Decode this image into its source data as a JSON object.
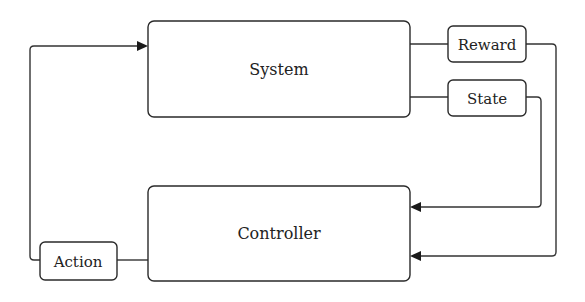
{
  "diagram": {
    "type": "block-diagram",
    "blocks": {
      "system": {
        "label": "System"
      },
      "controller": {
        "label": "Controller"
      }
    },
    "signals": {
      "reward": {
        "label": "Reward"
      },
      "state": {
        "label": "State"
      },
      "action": {
        "label": "Action"
      }
    },
    "edges": [
      {
        "from": "System",
        "to": "Reward"
      },
      {
        "from": "System",
        "to": "State"
      },
      {
        "from": "Reward",
        "to": "Controller"
      },
      {
        "from": "State",
        "to": "Controller"
      },
      {
        "from": "Controller",
        "to": "Action"
      },
      {
        "from": "Action",
        "to": "System"
      }
    ],
    "colors": {
      "line": "#333333",
      "background": "#ffffff"
    }
  }
}
